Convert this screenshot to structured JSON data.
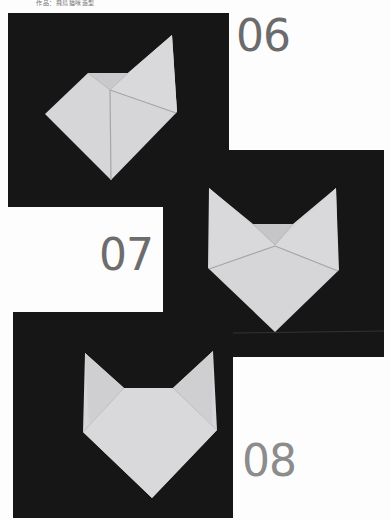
{
  "header": {
    "text": "作品：飛鳥猫咪造型"
  },
  "steps": [
    {
      "number": "06",
      "color": "#6b6b6b"
    },
    {
      "number": "07",
      "color": "#6d6d6d"
    },
    {
      "number": "08",
      "color": "#8c8c8c"
    }
  ],
  "colors": {
    "panel_background": "#161616",
    "paper": "#d6d6d8",
    "paper_shadow": "#c3c3c6",
    "crease": "#a6a6aa"
  }
}
